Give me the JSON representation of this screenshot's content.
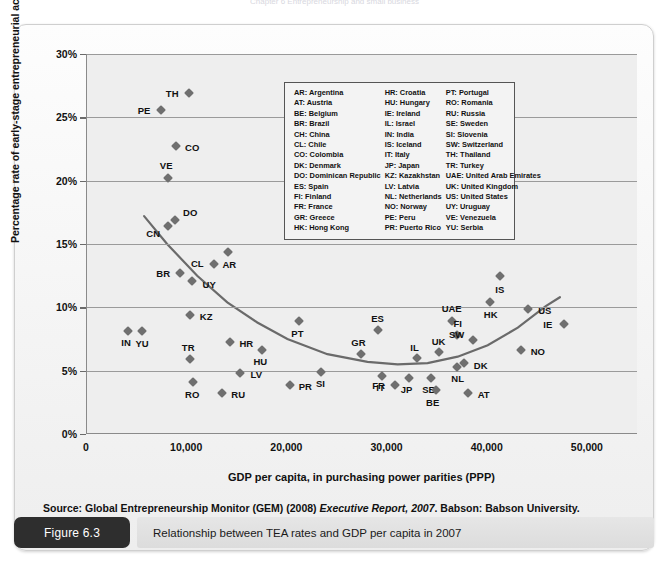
{
  "header_crop": "Chapter 6  Entrepreneurship and small business",
  "figure": {
    "tag": "Figure 6.3",
    "caption": "Relationship between TEA rates and GDP per capita in 2007"
  },
  "source": {
    "prefix": "Source: Global Entrepreneurship Monitor (GEM) (2008) ",
    "italic": "Executive Report, 2007",
    "suffix": ". Babson: Babson University."
  },
  "legend": {
    "columns": [
      [
        "AR: Argentina",
        "AT: Austria",
        "BE: Belgium",
        "BR: Brazil",
        "CH: China",
        "CL: Chile",
        "CO: Colombia",
        "DK: Denmark",
        "DO: Dominican Republic",
        "ES: Spain",
        "FI: Finland",
        "FR: France",
        "GR: Greece",
        "HK: Hong Kong"
      ],
      [
        "HR: Croatia",
        "HU: Hungary",
        "IE: Ireland",
        "IL: Israel",
        "IN: India",
        "IS: Iceland",
        "IT: Italy",
        "JP: Japan",
        "KZ: Kazakhstan",
        "LV: Latvia",
        "NL: Netherlands",
        "NO: Norway",
        "PE: Peru",
        "PR: Puerto Rico"
      ],
      [
        "PT: Portugal",
        "RO: Romania",
        "RU: Russia",
        "SE: Sweden",
        "SI: Slovenia",
        "SW: Switzerland",
        "TH: Thailand",
        "TR: Turkey",
        "UAE: United Arab Emirates",
        "UK: United Kingdom",
        "US: United States",
        "UY: Uruguay",
        "VE: Venezuela",
        "YU: Serbia"
      ]
    ]
  },
  "chart_data": {
    "type": "scatter",
    "title": "Relationship between TEA rates and GDP per capita in 2007",
    "xlabel": "GDP per capita, in purchasing power parities (PPP)",
    "ylabel": "Percentage rate of early-stage entrepreneurial activity",
    "xlim": [
      0,
      55000
    ],
    "ylim": [
      0,
      30
    ],
    "xticks": [
      0,
      10000,
      20000,
      30000,
      40000,
      50000
    ],
    "xtick_labels": [
      "0",
      "10,000",
      "20,000",
      "30,000",
      "40,000",
      "50,000"
    ],
    "yticks": [
      0,
      5,
      10,
      15,
      20,
      25,
      30
    ],
    "ytick_labels": [
      "0%",
      "5%",
      "10%",
      "15%",
      "20%",
      "25%",
      "30%"
    ],
    "grid": "horizontal",
    "legend_position": "top-center",
    "marker": "diamond",
    "marker_color": "#6f6f6f",
    "trend_color": "#6a6a6a",
    "points": [
      {
        "code": "TH",
        "x": 10200,
        "y": 26.9,
        "lx": -17,
        "ly": 0
      },
      {
        "code": "PE",
        "x": 7400,
        "y": 25.6,
        "lx": -17,
        "ly": 0
      },
      {
        "code": "CO",
        "x": 8900,
        "y": 22.7,
        "lx": 16,
        "ly": 1
      },
      {
        "code": "VE",
        "x": 8100,
        "y": 20.2,
        "lx": -2,
        "ly": -13
      },
      {
        "code": "DO",
        "x": 8800,
        "y": 16.9,
        "lx": 15,
        "ly": -8
      },
      {
        "code": "CN",
        "x": 8100,
        "y": 16.4,
        "lx": -15,
        "ly": 7
      },
      {
        "code": "AR",
        "x": 14100,
        "y": 14.4,
        "lx": 1,
        "ly": 12
      },
      {
        "code": "CL",
        "x": 12700,
        "y": 13.4,
        "lx": -17,
        "ly": -1
      },
      {
        "code": "BR",
        "x": 9300,
        "y": 12.7,
        "lx": -17,
        "ly": 0
      },
      {
        "code": "UY",
        "x": 10500,
        "y": 12.1,
        "lx": 17,
        "ly": 3
      },
      {
        "code": "IS",
        "x": 41200,
        "y": 12.5,
        "lx": 0,
        "ly": 13
      },
      {
        "code": "HK",
        "x": 40200,
        "y": 10.4,
        "lx": 1,
        "ly": 12
      },
      {
        "code": "US",
        "x": 44000,
        "y": 9.9,
        "lx": 17,
        "ly": 1
      },
      {
        "code": "KZ",
        "x": 10300,
        "y": 9.4,
        "lx": 16,
        "ly": 1
      },
      {
        "code": "PT",
        "x": 21200,
        "y": 8.9,
        "lx": -2,
        "ly": 12
      },
      {
        "code": "ES",
        "x": 29000,
        "y": 8.2,
        "lx": 0,
        "ly": -12
      },
      {
        "code": "UAE",
        "x": 36400,
        "y": 8.9,
        "lx": 0,
        "ly": -13
      },
      {
        "code": "IE",
        "x": 47600,
        "y": 8.7,
        "lx": -16,
        "ly": 0
      },
      {
        "code": "IN",
        "x": 4100,
        "y": 8.1,
        "lx": -2,
        "ly": 11
      },
      {
        "code": "YU",
        "x": 5500,
        "y": 8.1,
        "lx": 0,
        "ly": 12
      },
      {
        "code": "FI",
        "x": 36900,
        "y": 7.8,
        "lx": 1,
        "ly": -12
      },
      {
        "code": "SW",
        "x": 38500,
        "y": 7.4,
        "lx": -16,
        "ly": -6
      },
      {
        "code": "HR",
        "x": 14300,
        "y": 7.3,
        "lx": 16,
        "ly": 1
      },
      {
        "code": "NO",
        "x": 43300,
        "y": 6.6,
        "lx": 17,
        "ly": 1
      },
      {
        "code": "GR",
        "x": 27400,
        "y": 6.3,
        "lx": -3,
        "ly": -12
      },
      {
        "code": "HU",
        "x": 17500,
        "y": 6.6,
        "lx": -2,
        "ly": 11
      },
      {
        "code": "UK",
        "x": 35100,
        "y": 6.5,
        "lx": 0,
        "ly": -11
      },
      {
        "code": "IL",
        "x": 32900,
        "y": 6.0,
        "lx": -2,
        "ly": -11
      },
      {
        "code": "DK",
        "x": 37600,
        "y": 5.6,
        "lx": 17,
        "ly": 2
      },
      {
        "code": "TR",
        "x": 10300,
        "y": 5.9,
        "lx": -2,
        "ly": -12
      },
      {
        "code": "NL",
        "x": 36900,
        "y": 5.3,
        "lx": 1,
        "ly": 11
      },
      {
        "code": "LV",
        "x": 15300,
        "y": 4.8,
        "lx": 16,
        "ly": 1
      },
      {
        "code": "SI",
        "x": 23400,
        "y": 4.9,
        "lx": -1,
        "ly": 11
      },
      {
        "code": "IT",
        "x": 29400,
        "y": 4.6,
        "lx": -1,
        "ly": 11
      },
      {
        "code": "JP",
        "x": 32100,
        "y": 4.4,
        "lx": -2,
        "ly": 11
      },
      {
        "code": "SE",
        "x": 34300,
        "y": 4.4,
        "lx": -2,
        "ly": 11
      },
      {
        "code": "FR",
        "x": 30700,
        "y": 3.9,
        "lx": -16,
        "ly": 0
      },
      {
        "code": "RO",
        "x": 10600,
        "y": 4.1,
        "lx": -1,
        "ly": 12
      },
      {
        "code": "PR",
        "x": 20300,
        "y": 3.9,
        "lx": 15,
        "ly": 1
      },
      {
        "code": "BE",
        "x": 34800,
        "y": 3.5,
        "lx": -3,
        "ly": 12
      },
      {
        "code": "AT",
        "x": 38000,
        "y": 3.2,
        "lx": 16,
        "ly": 1
      },
      {
        "code": "RU",
        "x": 13500,
        "y": 3.2,
        "lx": 16,
        "ly": 1
      }
    ],
    "trend_line": {
      "description": "U-shaped fitted curve from low GDP high TEA down to minimum near 30,000 then rising",
      "points": [
        {
          "x": 5700,
          "y": 17.2
        },
        {
          "x": 8000,
          "y": 15.0
        },
        {
          "x": 11000,
          "y": 12.5
        },
        {
          "x": 14000,
          "y": 10.4
        },
        {
          "x": 17000,
          "y": 8.8
        },
        {
          "x": 20000,
          "y": 7.5
        },
        {
          "x": 24000,
          "y": 6.3
        },
        {
          "x": 28000,
          "y": 5.7
        },
        {
          "x": 31000,
          "y": 5.5
        },
        {
          "x": 34000,
          "y": 5.6
        },
        {
          "x": 37000,
          "y": 6.1
        },
        {
          "x": 40000,
          "y": 7.0
        },
        {
          "x": 43000,
          "y": 8.4
        },
        {
          "x": 45800,
          "y": 10.1
        },
        {
          "x": 47200,
          "y": 10.8
        }
      ]
    }
  }
}
